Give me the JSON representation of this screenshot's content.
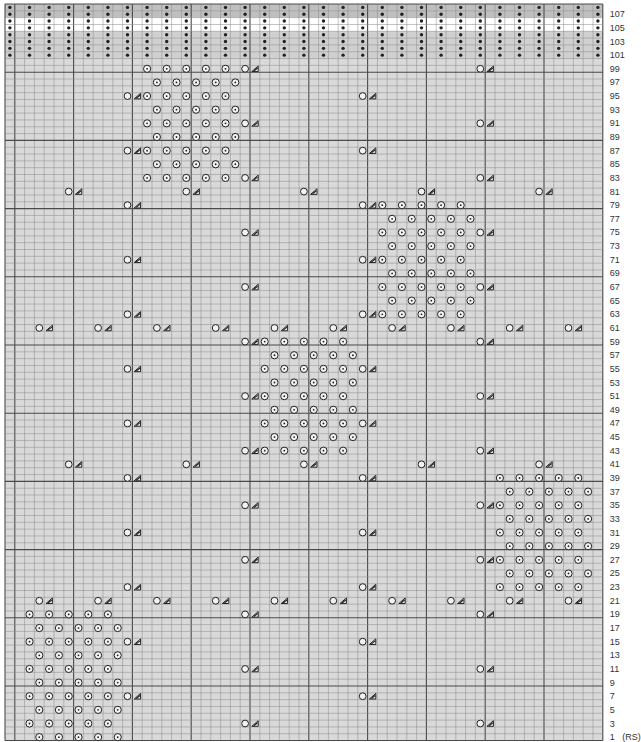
{
  "chart_data": {
    "type": "knitting-chart",
    "columns": 61,
    "rows": 108,
    "side_note": "(RS)",
    "row_labels": [
      1,
      3,
      5,
      7,
      9,
      11,
      13,
      15,
      17,
      19,
      21,
      23,
      25,
      27,
      29,
      31,
      33,
      35,
      37,
      39,
      41,
      43,
      45,
      47,
      49,
      51,
      53,
      55,
      57,
      59,
      61,
      63,
      65,
      67,
      69,
      71,
      73,
      75,
      77,
      79,
      81,
      83,
      85,
      87,
      89,
      91,
      93,
      95,
      97,
      99,
      101,
      103,
      105,
      107
    ],
    "colors": {
      "grid_bg": "#d9d9d9",
      "band_dark": "#bfbfbf",
      "band_light": "#d0d0d0",
      "band_white": "#ffffff",
      "line_thin": "#8a8a8a",
      "line_thick": "#4a4a4a",
      "symbol": "#222222"
    },
    "legend": {
      "purl_dot": "purl",
      "dotted_circle": "bobble",
      "open_circle": "yarn over",
      "triangle": "decrease"
    },
    "band_rows": {
      "purl_dot_columns": "even columns 0-60",
      "rows": [
        {
          "row": 108,
          "shade": "dark"
        },
        {
          "row": 107,
          "shade": "dark"
        },
        {
          "row": 106,
          "shade": "white"
        },
        {
          "row": 105,
          "shade": "white"
        },
        {
          "row": 104,
          "shade": "light"
        },
        {
          "row": 103,
          "shade": "light"
        },
        {
          "row": 102,
          "shade": "light"
        },
        {
          "row": 101,
          "shade": "light"
        }
      ]
    },
    "symbol_rows": [
      {
        "row": 99,
        "dots": [
          14,
          16,
          18,
          20,
          22
        ],
        "yo": [
          24,
          48
        ]
      },
      {
        "row": 97,
        "dots": [
          15,
          17,
          19,
          21,
          23
        ],
        "yo": []
      },
      {
        "row": 95,
        "dots": [
          14,
          16,
          18,
          20,
          22
        ],
        "yo": [
          12,
          36
        ]
      },
      {
        "row": 93,
        "dots": [
          15,
          17,
          19,
          21,
          23
        ],
        "yo": []
      },
      {
        "row": 91,
        "dots": [
          14,
          16,
          18,
          20,
          22
        ],
        "yo": [
          24,
          48
        ]
      },
      {
        "row": 89,
        "dots": [
          15,
          17,
          19,
          21,
          23
        ],
        "yo": []
      },
      {
        "row": 87,
        "dots": [
          14,
          16,
          18,
          20,
          22
        ],
        "yo": [
          12,
          36
        ]
      },
      {
        "row": 85,
        "dots": [
          15,
          17,
          19,
          21,
          23
        ],
        "yo": []
      },
      {
        "row": 83,
        "dots": [
          14,
          16,
          18,
          20,
          22
        ],
        "yo": [
          24,
          48
        ]
      },
      {
        "row": 81,
        "dots": [],
        "yo": [
          6,
          18,
          30,
          42,
          54
        ]
      },
      {
        "row": 79,
        "dots": [
          38,
          40,
          42,
          44,
          46
        ],
        "yo": [
          12,
          36
        ]
      },
      {
        "row": 77,
        "dots": [
          39,
          41,
          43,
          45,
          47
        ],
        "yo": []
      },
      {
        "row": 75,
        "dots": [
          38,
          40,
          42,
          44,
          46
        ],
        "yo": [
          24,
          48
        ]
      },
      {
        "row": 73,
        "dots": [
          39,
          41,
          43,
          45,
          47
        ],
        "yo": []
      },
      {
        "row": 71,
        "dots": [
          38,
          40,
          42,
          44,
          46
        ],
        "yo": [
          12,
          36
        ]
      },
      {
        "row": 69,
        "dots": [
          39,
          41,
          43,
          45,
          47
        ],
        "yo": []
      },
      {
        "row": 67,
        "dots": [
          38,
          40,
          42,
          44,
          46
        ],
        "yo": [
          24,
          48
        ]
      },
      {
        "row": 65,
        "dots": [
          39,
          41,
          43,
          45,
          47
        ],
        "yo": []
      },
      {
        "row": 63,
        "dots": [
          38,
          40,
          42,
          44,
          46
        ],
        "yo": [
          12,
          36
        ]
      },
      {
        "row": 61,
        "dots": [],
        "yo": [
          3,
          9,
          15,
          21,
          27,
          33,
          39,
          45,
          51,
          57
        ]
      },
      {
        "row": 59,
        "dots": [
          26,
          28,
          30,
          32,
          34
        ],
        "yo": [
          24,
          48
        ]
      },
      {
        "row": 57,
        "dots": [
          27,
          29,
          31,
          33,
          35
        ],
        "yo": []
      },
      {
        "row": 55,
        "dots": [
          26,
          28,
          30,
          32,
          34
        ],
        "yo": [
          12,
          36
        ]
      },
      {
        "row": 53,
        "dots": [
          27,
          29,
          31,
          33,
          35
        ],
        "yo": []
      },
      {
        "row": 51,
        "dots": [
          26,
          28,
          30,
          32,
          34
        ],
        "yo": [
          24,
          48
        ]
      },
      {
        "row": 49,
        "dots": [
          27,
          29,
          31,
          33,
          35
        ],
        "yo": []
      },
      {
        "row": 47,
        "dots": [
          26,
          28,
          30,
          32,
          34
        ],
        "yo": [
          12,
          36
        ]
      },
      {
        "row": 45,
        "dots": [
          27,
          29,
          31,
          33,
          35
        ],
        "yo": []
      },
      {
        "row": 43,
        "dots": [
          26,
          28,
          30,
          32,
          34
        ],
        "yo": [
          24,
          48
        ]
      },
      {
        "row": 41,
        "dots": [],
        "yo": [
          6,
          18,
          30,
          42,
          54
        ]
      },
      {
        "row": 39,
        "dots": [
          50,
          52,
          54,
          56,
          58
        ],
        "yo": [
          12,
          36
        ]
      },
      {
        "row": 37,
        "dots": [
          51,
          53,
          55,
          57,
          59
        ],
        "yo": []
      },
      {
        "row": 35,
        "dots": [
          50,
          52,
          54,
          56,
          58
        ],
        "yo": [
          24,
          48
        ]
      },
      {
        "row": 33,
        "dots": [
          51,
          53,
          55,
          57,
          59
        ],
        "yo": []
      },
      {
        "row": 31,
        "dots": [
          50,
          52,
          54,
          56,
          58
        ],
        "yo": [
          12,
          36
        ]
      },
      {
        "row": 29,
        "dots": [
          51,
          53,
          55,
          57,
          59
        ],
        "yo": []
      },
      {
        "row": 27,
        "dots": [
          50,
          52,
          54,
          56,
          58
        ],
        "yo": [
          24,
          48
        ]
      },
      {
        "row": 25,
        "dots": [
          51,
          53,
          55,
          57,
          59
        ],
        "yo": []
      },
      {
        "row": 23,
        "dots": [
          50,
          52,
          54,
          56,
          58
        ],
        "yo": [
          12,
          36
        ]
      },
      {
        "row": 21,
        "dots": [],
        "yo": [
          3,
          9,
          15,
          21,
          27,
          33,
          39,
          45,
          51,
          57
        ]
      },
      {
        "row": 19,
        "dots": [
          2,
          4,
          6,
          8,
          10
        ],
        "yo": [
          24,
          48
        ]
      },
      {
        "row": 17,
        "dots": [
          3,
          5,
          7,
          9,
          11
        ],
        "yo": []
      },
      {
        "row": 15,
        "dots": [
          2,
          4,
          6,
          8,
          10
        ],
        "yo": [
          12,
          36
        ]
      },
      {
        "row": 13,
        "dots": [
          3,
          5,
          7,
          9,
          11
        ],
        "yo": []
      },
      {
        "row": 11,
        "dots": [
          2,
          4,
          6,
          8,
          10
        ],
        "yo": [
          24,
          48
        ]
      },
      {
        "row": 9,
        "dots": [
          3,
          5,
          7,
          9,
          11
        ],
        "yo": []
      },
      {
        "row": 7,
        "dots": [
          2,
          4,
          6,
          8,
          10
        ],
        "yo": [
          12,
          36
        ]
      },
      {
        "row": 5,
        "dots": [
          3,
          5,
          7,
          9,
          11
        ],
        "yo": []
      },
      {
        "row": 3,
        "dots": [
          2,
          4,
          6,
          8,
          10
        ],
        "yo": [
          24,
          48
        ]
      },
      {
        "row": 1,
        "dots": [
          3,
          5,
          7,
          9,
          11
        ],
        "yo": []
      }
    ]
  }
}
